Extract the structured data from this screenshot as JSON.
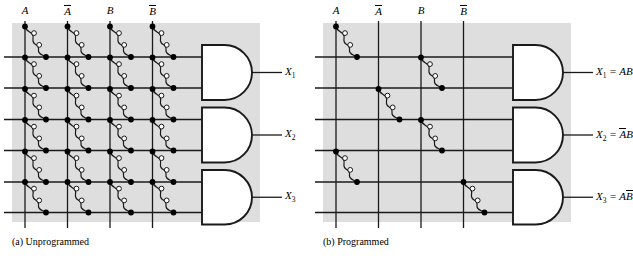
{
  "figure": {
    "type": "pla-and-array-diagram",
    "colors": {
      "array_background": "#dedede",
      "line": "#1a1a1a",
      "page_background": "#ffffff",
      "fuse_open_circle_fill": "#ffffff",
      "node_dot_fill": "#000000"
    }
  },
  "panels": [
    {
      "id": "a",
      "caption": "(a)  Unprogrammed",
      "caption_marker": "(a)",
      "caption_text": "Unprogrammed",
      "input_labels": [
        {
          "base": "A",
          "overbar": false
        },
        {
          "base": "A",
          "overbar": true
        },
        {
          "base": "B",
          "overbar": false
        },
        {
          "base": "B",
          "overbar": true
        }
      ],
      "gates": [
        {
          "name": "and-gate-1",
          "output_label": "X",
          "output_sub": "1",
          "output_expr": ""
        },
        {
          "name": "and-gate-2",
          "output_label": "X",
          "output_sub": "2",
          "output_expr": ""
        },
        {
          "name": "and-gate-3",
          "output_label": "X",
          "output_sub": "3",
          "output_expr": ""
        }
      ],
      "rows": 6,
      "columns": 4,
      "fuse_matrix": [
        [
          1,
          1,
          1,
          1
        ],
        [
          1,
          1,
          1,
          1
        ],
        [
          1,
          1,
          1,
          1
        ],
        [
          1,
          1,
          1,
          1
        ],
        [
          1,
          1,
          1,
          1
        ],
        [
          1,
          1,
          1,
          1
        ]
      ]
    },
    {
      "id": "b",
      "caption": "(b)  Programmed",
      "caption_marker": "(b)",
      "caption_text": "Programmed",
      "input_labels": [
        {
          "base": "A",
          "overbar": false
        },
        {
          "base": "A",
          "overbar": true
        },
        {
          "base": "B",
          "overbar": false
        },
        {
          "base": "B",
          "overbar": true
        }
      ],
      "gates": [
        {
          "name": "and-gate-1",
          "output_label": "X",
          "output_sub": "1",
          "output_expr": "= AB",
          "expr_terms": [
            {
              "base": "A",
              "overbar": false
            },
            {
              "base": "B",
              "overbar": false
            }
          ]
        },
        {
          "name": "and-gate-2",
          "output_label": "X",
          "output_sub": "2",
          "output_expr": "= AB",
          "expr_terms": [
            {
              "base": "A",
              "overbar": true
            },
            {
              "base": "B",
              "overbar": false
            }
          ]
        },
        {
          "name": "and-gate-3",
          "output_label": "X",
          "output_sub": "3",
          "output_expr": "= AB",
          "expr_terms": [
            {
              "base": "A",
              "overbar": false
            },
            {
              "base": "B",
              "overbar": true
            }
          ]
        }
      ],
      "rows": 6,
      "columns": 4,
      "fuse_matrix": [
        [
          1,
          0,
          0,
          0
        ],
        [
          0,
          0,
          1,
          0
        ],
        [
          0,
          1,
          0,
          0
        ],
        [
          0,
          0,
          1,
          0
        ],
        [
          1,
          0,
          0,
          0
        ],
        [
          0,
          0,
          0,
          1
        ]
      ]
    }
  ]
}
